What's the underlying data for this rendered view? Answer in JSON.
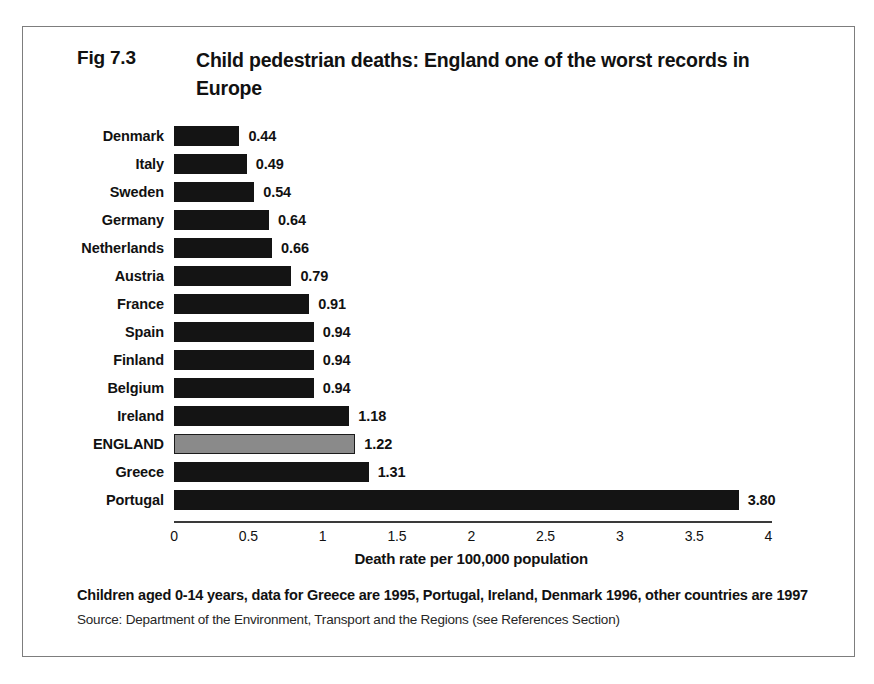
{
  "figure": {
    "number": "Fig 7.3",
    "title": "Child pedestrian deaths:  England one of the worst records in Europe"
  },
  "footnote": {
    "note": "Children aged 0-14 years, data for Greece are 1995, Portugal, Ireland, Denmark 1996, other countries are 1997",
    "source": "Source: Department of the Environment, Transport and the Regions (see References Section)"
  },
  "colors": {
    "bar": "#141414",
    "highlight_bar": "#8a8a8a",
    "highlight_border": "#1b1b1b",
    "frame": "#7d7d7d",
    "axis": "#3a3a3a"
  },
  "chart_data": {
    "type": "bar",
    "orientation": "horizontal",
    "title": "Child pedestrian deaths:  England one of the worst records in Europe",
    "xlabel": "Death rate per 100,000 population",
    "ylabel": "",
    "xlim": [
      0,
      4
    ],
    "xticks": [
      "0",
      "0.5",
      "1",
      "1.5",
      "2",
      "2.5",
      "3",
      "3.5",
      "4"
    ],
    "xtick_values": [
      0,
      0.5,
      1,
      1.5,
      2,
      2.5,
      3,
      3.5,
      4
    ],
    "grid": false,
    "legend": false,
    "highlight_category": "ENGLAND",
    "categories": [
      "Denmark",
      "Italy",
      "Sweden",
      "Germany",
      "Netherlands",
      "Austria",
      "France",
      "Spain",
      "Finland",
      "Belgium",
      "Ireland",
      "ENGLAND",
      "Greece",
      "Portugal"
    ],
    "values": [
      0.44,
      0.49,
      0.54,
      0.64,
      0.66,
      0.79,
      0.91,
      0.94,
      0.94,
      0.94,
      1.18,
      1.22,
      1.31,
      3.8
    ],
    "value_labels": [
      "0.44",
      "0.49",
      "0.54",
      "0.64",
      "0.66",
      "0.79",
      "0.91",
      "0.94",
      "0.94",
      "0.94",
      "1.18",
      "1.22",
      "1.31",
      "3.80"
    ]
  }
}
